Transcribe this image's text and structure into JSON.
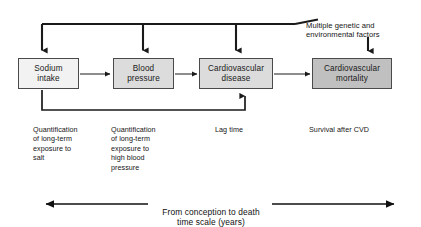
{
  "figure": {
    "type": "flow-diagram",
    "background_color": "#ffffff",
    "line_color": "#1a1a1a",
    "nodes": [
      {
        "id": "sodium-intake",
        "label": "Sodium\nintake",
        "line1": "Sodium",
        "line2": "intake",
        "fill": "#f2f2f2",
        "border": "#4a4a4a"
      },
      {
        "id": "blood-pressure",
        "label": "Blood\npressure",
        "line1": "Blood",
        "line2": "pressure",
        "fill": "#dcdcdc",
        "border": "#4a4a4a"
      },
      {
        "id": "cardiovascular-disease",
        "label": "Cardiovascular\ndisease",
        "line1": "Cardiovascular",
        "line2": "disease",
        "fill": "#dcdcdc",
        "border": "#4a4a4a"
      },
      {
        "id": "cardiovascular-mortality",
        "label": "Cardiovascular\nmortality",
        "line1": "Cardiovascular",
        "line2": "mortality",
        "fill": "#c0c0c0",
        "border": "#4a4a4a"
      }
    ],
    "external_factor": {
      "id": "multiple-genetic-and-environmental-factors",
      "line1": "Multiple genetic and",
      "line2": "environmental factors"
    },
    "captions": [
      {
        "id": "quantification-salt",
        "text": "Quantification\nof long-term\nexposure to\nsalt"
      },
      {
        "id": "quantification-blood-pressure",
        "text": "Quantification\nof long-term\nexposure to\nhigh blood\npressure"
      },
      {
        "id": "lag-time",
        "text": "Lag time"
      },
      {
        "id": "survival-after-cvd",
        "text": "Survival after CVD"
      }
    ],
    "timeline": {
      "id": "time-scale",
      "line1": "From conception to death",
      "line2": "time scale (years)"
    }
  }
}
